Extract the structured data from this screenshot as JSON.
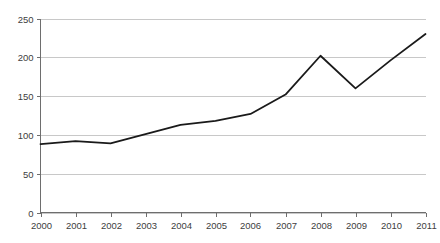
{
  "chart_data": {
    "type": "line",
    "title": "",
    "subtitle": "",
    "xlabel": "",
    "ylabel": "",
    "categories": [
      "2000",
      "2001",
      "2002",
      "2003",
      "2004",
      "2005",
      "2006",
      "2007",
      "2008",
      "2009",
      "2010",
      "2011"
    ],
    "series": [
      {
        "name": "",
        "values": [
          88,
          92,
          89,
          101,
          113,
          118,
          127,
          152,
          202,
          160,
          196,
          230
        ]
      }
    ],
    "ylim": [
      0,
      250
    ],
    "ytick_labels": [
      "0",
      "50",
      "100",
      "150",
      "200",
      "250"
    ],
    "ytick_values": [
      0,
      50,
      100,
      150,
      200,
      250
    ],
    "grid": true,
    "grid_axis": "y",
    "legend": false,
    "legend_position": "none",
    "markers": false,
    "colors": {
      "line": "#1a1a1a",
      "gridline": "#c8c8c8",
      "axis": "#6e6e6e",
      "tick_text": "#404040",
      "background": "#ffffff"
    }
  }
}
